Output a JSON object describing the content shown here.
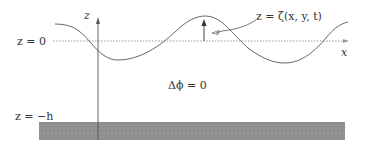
{
  "diagram": {
    "labels": {
      "z_axis": "z",
      "x_axis": "x",
      "surface_level": "z = 0",
      "bottom_level": "z = −h",
      "free_surface": "z = ζ(x, y, t)",
      "laplace": "Δϕ = 0"
    },
    "colors": {
      "line": "#555555",
      "dotted": "#9a9a9a",
      "seabed": "#8f8f8f",
      "text": "#333333"
    }
  }
}
